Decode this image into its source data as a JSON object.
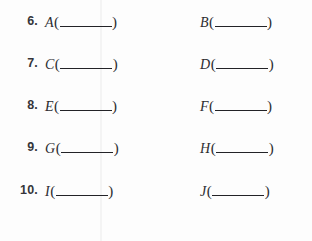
{
  "page": {
    "kind": "fill-in-the-blank-worksheet",
    "background_color": "#fdfdfd",
    "text_color": "#2c2c30",
    "rule_color": "#232327"
  },
  "rows": [
    {
      "number": "6.",
      "items": [
        {
          "letter": "A",
          "open": "(",
          "blank": "",
          "close": ")"
        },
        {
          "letter": "B",
          "open": "(",
          "blank": "",
          "close": ")"
        }
      ]
    },
    {
      "number": "7.",
      "items": [
        {
          "letter": "C",
          "open": "(",
          "blank": "",
          "close": ")"
        },
        {
          "letter": "D",
          "open": "(",
          "blank": "",
          "close": ")"
        }
      ]
    },
    {
      "number": "8.",
      "items": [
        {
          "letter": "E",
          "open": "(",
          "blank": "",
          "close": ")"
        },
        {
          "letter": "F",
          "open": "(",
          "blank": "",
          "close": ")"
        }
      ]
    },
    {
      "number": "9.",
      "items": [
        {
          "letter": "G",
          "open": "(",
          "blank": "",
          "close": ")"
        },
        {
          "letter": "H",
          "open": "(",
          "blank": "",
          "close": ")"
        }
      ]
    },
    {
      "number": "10.",
      "items": [
        {
          "letter": "I",
          "open": "(",
          "blank": "",
          "close": ")"
        },
        {
          "letter": "J",
          "open": "(",
          "blank": "",
          "close": ")"
        }
      ]
    }
  ]
}
